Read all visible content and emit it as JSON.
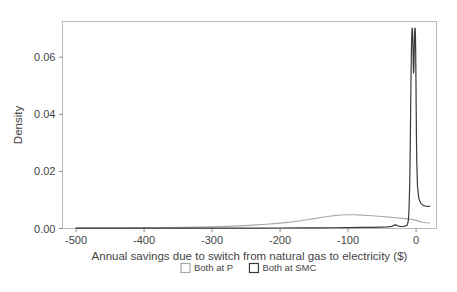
{
  "chart_data": {
    "type": "line",
    "title": "",
    "xlabel": "Annual savings due to switch from natural gas to electricity ($)",
    "ylabel": "Density",
    "xlim": [
      -520,
      30
    ],
    "ylim": [
      0,
      0.0725
    ],
    "xticks": [
      -500,
      -400,
      -300,
      -200,
      -100,
      0
    ],
    "xtick_labels": [
      "-500",
      "-400",
      "-300",
      "-200",
      "-100",
      "0"
    ],
    "yticks": [
      0.0,
      0.02,
      0.04,
      0.06
    ],
    "ytick_labels": [
      "0.00",
      "0.02",
      "0.04",
      "0.06"
    ],
    "grid": false,
    "legend_position": "bottom",
    "series": [
      {
        "name": "Both at P",
        "color": "#a8a8a8",
        "marker_style": "square-outline",
        "x": [
          -500,
          -480,
          -460,
          -440,
          -420,
          -400,
          -380,
          -360,
          -340,
          -320,
          -300,
          -280,
          -260,
          -240,
          -220,
          -200,
          -185,
          -170,
          -160,
          -150,
          -140,
          -130,
          -120,
          -110,
          -100,
          -90,
          -80,
          -70,
          -60,
          -50,
          -40,
          -30,
          -20,
          -10,
          -5,
          0,
          5,
          10,
          15,
          20
        ],
        "y": [
          0.00012,
          0.00014,
          0.00016,
          0.00018,
          0.00021,
          0.00024,
          0.00028,
          0.00033,
          0.00039,
          0.00047,
          0.00058,
          0.00073,
          0.00093,
          0.00118,
          0.0015,
          0.0019,
          0.00225,
          0.0027,
          0.00305,
          0.00345,
          0.00385,
          0.0042,
          0.0045,
          0.00472,
          0.00482,
          0.0048,
          0.0047,
          0.00455,
          0.00437,
          0.00418,
          0.00398,
          0.00378,
          0.00355,
          0.0033,
          0.0031,
          0.00285,
          0.0025,
          0.00218,
          0.002,
          0.00195
        ]
      },
      {
        "name": "Both at SMC",
        "color": "#3a3a3a",
        "marker_style": "square-outline",
        "x": [
          -500,
          -470,
          -440,
          -410,
          -380,
          -350,
          -320,
          -290,
          -260,
          -230,
          -200,
          -170,
          -140,
          -120,
          -100,
          -80,
          -65,
          -50,
          -42,
          -36,
          -33,
          -31,
          -29,
          -27,
          -24,
          -21,
          -19,
          -17,
          -15,
          -13,
          -11.5,
          -10.5,
          -9.5,
          -8.8,
          -8.2,
          -7.6,
          -7.0,
          -6.4,
          -5.8,
          -5.2,
          -4.6,
          -4.2,
          -3.8,
          -3.4,
          -3.0,
          -2.6,
          -2.2,
          -1.8,
          -1.4,
          -1.0,
          -0.6,
          -0.2,
          0.2,
          0.6,
          1.0,
          2.0,
          4.0,
          7.0,
          11.0,
          15.0,
          18.0,
          20.0
        ],
        "y": [
          0.0001,
          0.0001,
          0.00011,
          0.00011,
          0.00012,
          0.00012,
          0.00013,
          0.00014,
          0.00015,
          0.00016,
          0.00018,
          0.0002,
          0.00023,
          0.00026,
          0.0003,
          0.00036,
          0.00042,
          0.0005,
          0.00058,
          0.00075,
          0.00105,
          0.00128,
          0.0012,
          0.00095,
          0.00075,
          0.0007,
          0.00072,
          0.00078,
          0.0009,
          0.00125,
          0.0026,
          0.006,
          0.0145,
          0.025,
          0.037,
          0.05,
          0.061,
          0.0675,
          0.0702,
          0.0695,
          0.064,
          0.058,
          0.0545,
          0.055,
          0.059,
          0.064,
          0.068,
          0.0701,
          0.0702,
          0.068,
          0.062,
          0.052,
          0.04,
          0.03,
          0.023,
          0.015,
          0.0105,
          0.0088,
          0.008,
          0.0078,
          0.00775,
          0.0077
        ]
      }
    ]
  },
  "legend": {
    "items": [
      {
        "label": "Both at P",
        "color": "#a8a8a8"
      },
      {
        "label": "Both at SMC",
        "color": "#3a3a3a"
      }
    ]
  },
  "axes": {
    "y_title": "Density",
    "x_title": "Annual savings due to switch from natural gas to electricity ($)"
  }
}
